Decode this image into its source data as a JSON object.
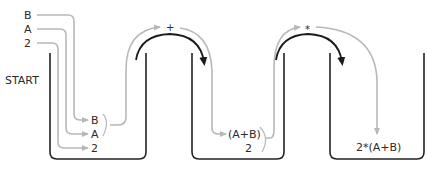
{
  "diagram": {
    "type": "stack-machine-evaluation",
    "start_label": "START",
    "inputs": [
      "B",
      "A",
      "2"
    ],
    "stacks": [
      {
        "name": "stack-1",
        "items": [
          "B",
          "A",
          "2"
        ]
      },
      {
        "name": "stack-2",
        "items": [
          "(A+B)",
          "2"
        ]
      },
      {
        "name": "stack-3",
        "items": [
          "2*(A+B)"
        ]
      }
    ],
    "operations": [
      {
        "symbol": "+",
        "from": "stack-1",
        "to": "stack-2"
      },
      {
        "symbol": "*",
        "from": "stack-2",
        "to": "stack-3"
      }
    ],
    "colors": {
      "wall": "#222222",
      "flow": "#b8b8b8",
      "operation": "#1a1a1a"
    }
  }
}
